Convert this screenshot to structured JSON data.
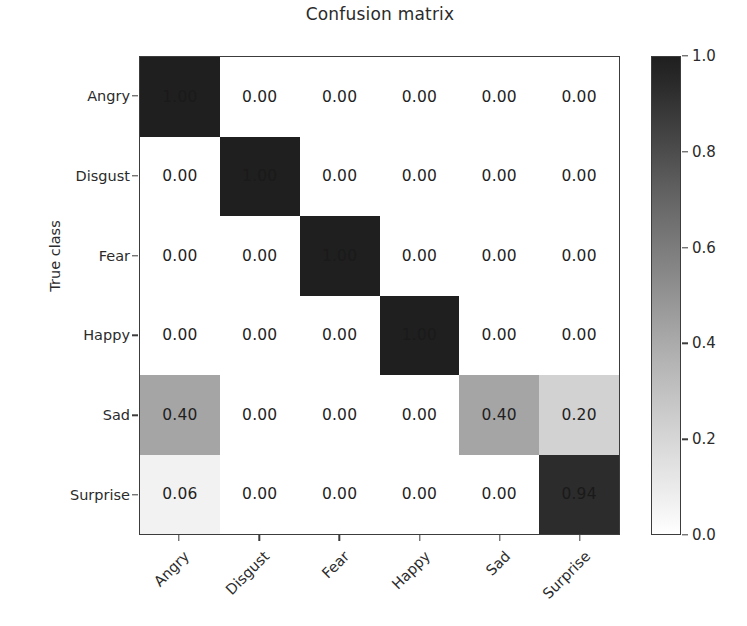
{
  "chart_data": {
    "type": "heatmap",
    "title": "Confusion matrix",
    "xlabel": "",
    "ylabel": "True class",
    "categories": [
      "Angry",
      "Disgust",
      "Fear",
      "Happy",
      "Sad",
      "Surprise"
    ],
    "x_tick_labels": [
      "Angry",
      "Disgust",
      "Fear",
      "Happy",
      "Sad",
      "Surprise"
    ],
    "y_tick_labels": [
      "Angry",
      "Disgust",
      "Fear",
      "Happy",
      "Sad",
      "Surprise"
    ],
    "rows": [
      {
        "label": "Angry",
        "values": [
          "1.00",
          "0.00",
          "0.00",
          "0.00",
          "0.00",
          "0.00"
        ]
      },
      {
        "label": "Disgust",
        "values": [
          "0.00",
          "1.00",
          "0.00",
          "0.00",
          "0.00",
          "0.00"
        ]
      },
      {
        "label": "Fear",
        "values": [
          "0.00",
          "0.00",
          "1.00",
          "0.00",
          "0.00",
          "0.00"
        ]
      },
      {
        "label": "Happy",
        "values": [
          "0.00",
          "0.00",
          "0.00",
          "1.00",
          "0.00",
          "0.00"
        ]
      },
      {
        "label": "Sad",
        "values": [
          "0.40",
          "0.00",
          "0.00",
          "0.00",
          "0.40",
          "0.20"
        ]
      },
      {
        "label": "Surprise",
        "values": [
          "0.06",
          "0.00",
          "0.00",
          "0.00",
          "0.00",
          "0.94"
        ]
      }
    ],
    "matrix": [
      [
        1.0,
        0.0,
        0.0,
        0.0,
        0.0,
        0.0
      ],
      [
        0.0,
        1.0,
        0.0,
        0.0,
        0.0,
        0.0
      ],
      [
        0.0,
        0.0,
        1.0,
        0.0,
        0.0,
        0.0
      ],
      [
        0.0,
        0.0,
        0.0,
        1.0,
        0.0,
        0.0
      ],
      [
        0.4,
        0.0,
        0.0,
        0.0,
        0.4,
        0.2
      ],
      [
        0.06,
        0.0,
        0.0,
        0.0,
        0.0,
        0.94
      ]
    ],
    "colormap": "grays-reversed",
    "colorbar": {
      "ticks": [
        "1.0",
        "0.8",
        "0.6",
        "0.4",
        "0.2",
        "0.0"
      ],
      "tick_values": [
        1.0,
        0.8,
        0.6,
        0.4,
        0.2,
        0.0
      ],
      "vmin": 0.0,
      "vmax": 1.0,
      "low_color": "#ffffff",
      "high_color": "#1f1f1f"
    },
    "grid": false,
    "legend": "colorbar-right",
    "text_color": "#262626",
    "axis_color": "#3c3c3c",
    "background_color": "#ffffff"
  }
}
